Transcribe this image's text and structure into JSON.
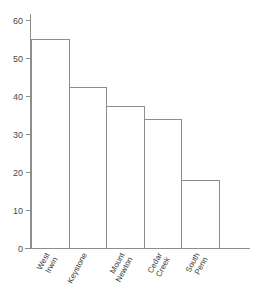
{
  "chart_data": {
    "type": "bar",
    "title": "",
    "subtitle": "",
    "xlabel": "",
    "ylabel": "",
    "categories": [
      "West Irwin",
      "Keystone",
      "Mount Newton",
      "Cedar Creek",
      "South Penn"
    ],
    "category_lines": [
      [
        "West",
        "Irwin"
      ],
      [
        "Keystone"
      ],
      [
        "Mount",
        "Newton"
      ],
      [
        "Cedar",
        "Creek"
      ],
      [
        "South",
        "Penn"
      ]
    ],
    "values": [
      55,
      42.5,
      37.5,
      34,
      18
    ],
    "ylim": [
      0,
      62
    ],
    "yticks": [
      0,
      10,
      20,
      30,
      40,
      50,
      60
    ],
    "ytick_labels": [
      "0",
      "10",
      "20",
      "30",
      "40",
      "50",
      "60"
    ],
    "grid": false,
    "legend": false,
    "legend_position": "none",
    "series": [
      {
        "name": "",
        "values": [
          55,
          42.5,
          37.5,
          34,
          18
        ]
      }
    ],
    "bar_fill_color": "#ffffff",
    "bar_edge_color": "#8d8d8d",
    "axis_color": "#8d8d8d",
    "text_color": "#3d3d3d",
    "background_color": "#ffffff",
    "category_label_rotation": -62
  }
}
